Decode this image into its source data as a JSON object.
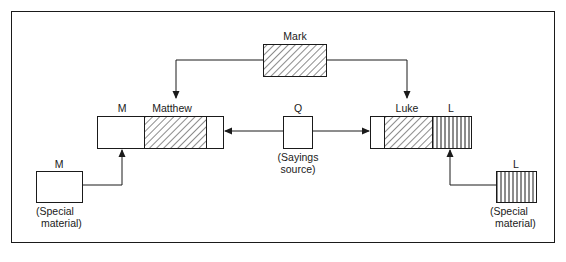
{
  "diagram": {
    "type": "source-relationship diagram (Synoptic Problem, four-source hypothesis)",
    "nodes": {
      "mark": {
        "label": "Mark",
        "fill": "diagonal-hatch"
      },
      "matthew": {
        "label": "Matthew",
        "segment_label": "M",
        "segments": [
          "M (blank)",
          "Mark (diagonal-hatch)",
          "Q (blank)"
        ]
      },
      "q": {
        "label": "Q",
        "caption_line1": "(Sayings",
        "caption_line2": "source)"
      },
      "luke": {
        "label": "Luke",
        "segment_label": "L",
        "segments": [
          "Q (blank)",
          "Mark (diagonal-hatch)",
          "L (vertical-stripes)"
        ]
      },
      "m_special": {
        "label": "M",
        "caption_line1": "(Special",
        "caption_line2": "material)",
        "fill": "blank"
      },
      "l_special": {
        "label": "L",
        "caption_line1": "(Special",
        "caption_line2": "material)",
        "fill": "vertical-stripes"
      }
    },
    "edges": [
      {
        "from": "Mark",
        "to": "Matthew"
      },
      {
        "from": "Mark",
        "to": "Luke"
      },
      {
        "from": "Q",
        "to": "Matthew"
      },
      {
        "from": "Q",
        "to": "Luke"
      },
      {
        "from": "M (Special material)",
        "to": "Matthew"
      },
      {
        "from": "L (Special material)",
        "to": "Luke"
      }
    ],
    "colors": {
      "stroke": "#1a1a1a",
      "background": "#ffffff"
    }
  }
}
